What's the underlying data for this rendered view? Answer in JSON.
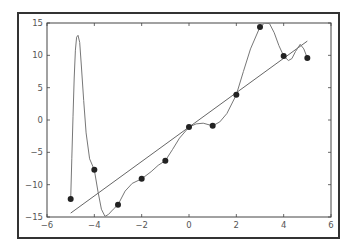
{
  "chart_data": {
    "type": "scatter",
    "title": "",
    "xlabel": "",
    "ylabel": "",
    "xlim": [
      -6,
      6
    ],
    "ylim": [
      -15,
      15
    ],
    "grid": false,
    "legend": null,
    "xticks": [
      -6,
      -4,
      -2,
      0,
      2,
      4,
      6
    ],
    "yticks": [
      15,
      10,
      5,
      0,
      -5,
      -10,
      -15
    ],
    "xtick_labels": [
      "−6",
      "−4",
      "−2",
      "0",
      "2",
      "4",
      "6"
    ],
    "ytick_labels": [
      "15",
      "10",
      "5",
      "0",
      "−5",
      "−10",
      "−15"
    ],
    "series": [
      {
        "name": "data points",
        "kind": "scatter",
        "color": "#222222",
        "x": [
          -5,
          -4,
          -3,
          -2,
          -1,
          0,
          1,
          2,
          3,
          4,
          5
        ],
        "y": [
          -12.2,
          -7.7,
          -13.1,
          -9.1,
          -6.3,
          -1.1,
          -0.9,
          3.9,
          14.4,
          9.9,
          9.6
        ]
      },
      {
        "name": "linear fit",
        "kind": "line",
        "color": "#666666",
        "x": [
          -5,
          5
        ],
        "y": [
          -14.4,
          12.2
        ]
      },
      {
        "name": "high-degree polynomial fit",
        "kind": "line",
        "color": "#777777",
        "x": [
          -5,
          -4.95,
          -4.9,
          -4.85,
          -4.8,
          -4.75,
          -4.69,
          -4.62,
          -4.55,
          -4.45,
          -4.35,
          -4.2,
          -4.0,
          -3.85,
          -3.7,
          -3.55,
          -3.4,
          -3.2,
          -3.0,
          -2.7,
          -2.4,
          -2.0,
          -1.6,
          -1.3,
          -1.0,
          -0.7,
          -0.4,
          0.0,
          0.3,
          0.6,
          1.0,
          1.3,
          1.6,
          2.0,
          2.3,
          2.6,
          3.0,
          3.2,
          3.4,
          3.6,
          3.8,
          4.0,
          4.2,
          4.35,
          4.5,
          4.7,
          4.85,
          5.0
        ],
        "y": [
          -12.2,
          -6.0,
          0.5,
          6.5,
          10.8,
          12.8,
          13.1,
          12.0,
          8.5,
          3.0,
          -2.0,
          -6.0,
          -7.7,
          -11.0,
          -13.8,
          -14.9,
          -14.6,
          -13.8,
          -13.1,
          -11.0,
          -9.8,
          -9.1,
          -8.0,
          -7.0,
          -6.3,
          -4.6,
          -2.8,
          -1.1,
          -0.6,
          -0.5,
          -0.9,
          -0.3,
          1.0,
          3.9,
          7.5,
          11.0,
          14.4,
          15.0,
          14.9,
          13.5,
          11.5,
          9.9,
          9.2,
          9.5,
          10.6,
          11.7,
          11.0,
          9.6
        ]
      }
    ]
  },
  "colors": {
    "frame": "#333333",
    "axes": "#444444",
    "points": "#222222",
    "fit_line": "#666666",
    "curve": "#777777"
  }
}
